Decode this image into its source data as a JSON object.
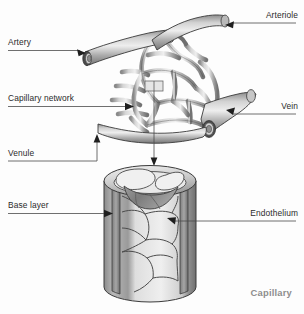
{
  "figure": {
    "background_color": "#fdfdfd",
    "label_color": "#2b2b2b",
    "caption_color": "#8d8d8d",
    "vessel_fill_light": "#d9d9d9",
    "vessel_fill_mid": "#a8a8a8",
    "vessel_fill_dark": "#6e6e6e",
    "outline_color": "#3a3a3a"
  },
  "labels": {
    "artery": "Artery",
    "capillary_network": "Capillary network",
    "venule": "Venule",
    "base_layer": "Base layer",
    "arteriole": "Arteriole",
    "vein": "Vein",
    "endothelium": "Endothelium",
    "capillary_caption": "Capillary"
  }
}
